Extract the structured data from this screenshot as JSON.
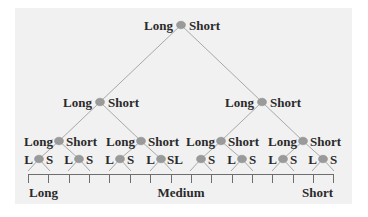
{
  "diagram": {
    "type": "binary-tree",
    "colors": {
      "background": "#f1f1f1",
      "node_fill": "#9a9a9a",
      "edge": "#a8a8a8",
      "text": "#2a2a2a"
    },
    "levels": [
      {
        "level": 0,
        "nodes": [
          {
            "left_label": "Long",
            "right_label": "Short"
          }
        ]
      },
      {
        "level": 1,
        "nodes": [
          {
            "left_label": "Long",
            "right_label": "Short"
          },
          {
            "left_label": "Long",
            "right_label": "Short"
          }
        ]
      },
      {
        "level": 2,
        "nodes": [
          {
            "left_label": "Long",
            "right_label": "Short"
          },
          {
            "left_label": "Long",
            "right_label": "Short"
          },
          {
            "left_label": "Long",
            "right_label": "Short"
          },
          {
            "left_label": "Long",
            "right_label": "Short"
          }
        ]
      },
      {
        "level": 3,
        "nodes": [
          {
            "left_label": "L",
            "right_label": "S"
          },
          {
            "left_label": "L",
            "right_label": "S"
          },
          {
            "left_label": "L",
            "right_label": "S"
          },
          {
            "left_label": "L",
            "right_label": "SL"
          },
          {
            "left_label": "",
            "right_label": "S"
          },
          {
            "left_label": "L",
            "right_label": "S"
          },
          {
            "left_label": "L",
            "right_label": "S"
          },
          {
            "left_label": "L",
            "right_label": "S"
          }
        ]
      }
    ],
    "axis": {
      "tick_count": 16,
      "labels": {
        "left": "Long",
        "center": "Medium",
        "right": "Short"
      }
    }
  }
}
